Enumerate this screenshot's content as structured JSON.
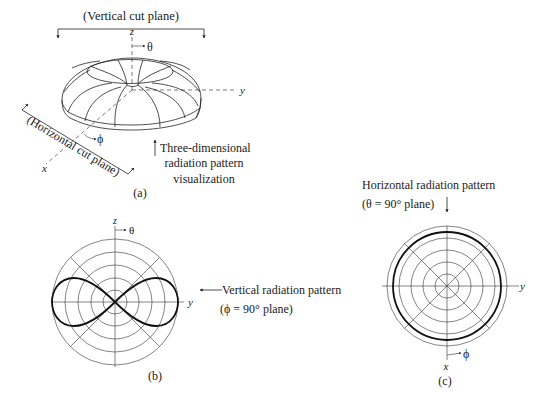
{
  "figure_a": {
    "label": "(a)",
    "vertical_cut_label": "(Vertical cut plane)",
    "horizontal_cut_label": "(Horizontal cut plane)",
    "annotation_lines": [
      "Three-dimensional",
      "radiation pattern",
      "visualization"
    ],
    "axes": {
      "x": "x",
      "y": "y",
      "z": "z"
    },
    "angles": {
      "theta": "θ",
      "phi": "ϕ"
    }
  },
  "figure_b": {
    "label": "(b)",
    "title_line1": "Vertical radiation pattern",
    "title_line2": "(ϕ = 90° plane)",
    "axes": {
      "vertical": "z",
      "horizontal": "y"
    },
    "angle": "θ",
    "ring_count": 5,
    "pattern_shape": "figure-eight (sin θ)"
  },
  "figure_c": {
    "label": "(c)",
    "title_line1": "Horizontal radiation pattern",
    "title_line2": "(θ = 90° plane)",
    "axes": {
      "vertical_down": "x",
      "horizontal": "y"
    },
    "angle": "ϕ",
    "ring_count": 6,
    "pattern_shape": "circle (omnidirectional)"
  },
  "colors": {
    "ink": "#1a1a1a",
    "background": "#ffffff"
  }
}
